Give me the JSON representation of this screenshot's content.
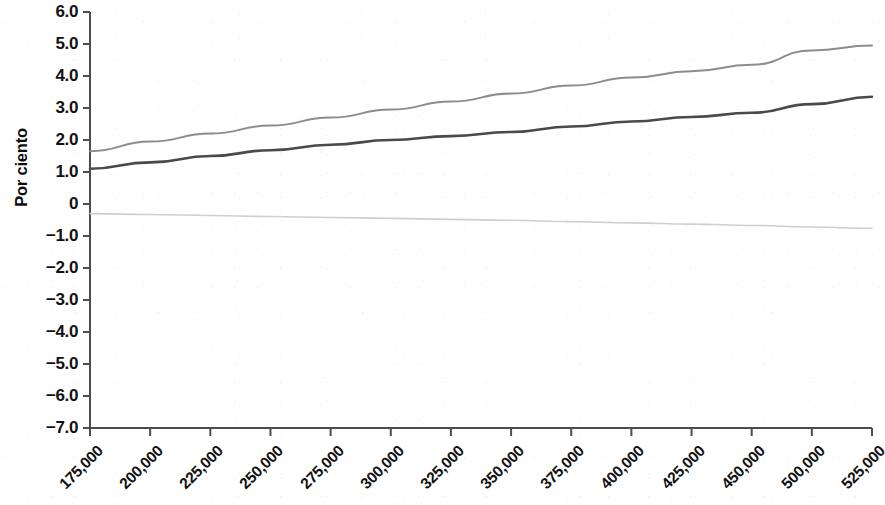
{
  "chart_data": {
    "type": "line",
    "title": "",
    "subtitle": "",
    "xlabel": "",
    "ylabel": "Por ciento",
    "grid": false,
    "legend": "none",
    "ylim": [
      -7.0,
      6.0
    ],
    "ytick_labels": [
      "6.0",
      "5.0",
      "4.0",
      "3.0",
      "2.0",
      "1.0",
      "0",
      "-1.0",
      "-2.0",
      "-3.0",
      "-4.0",
      "-5.0",
      "-6.0",
      "-7.0"
    ],
    "ytick_values": [
      6.0,
      5.0,
      4.0,
      3.0,
      2.0,
      1.0,
      0,
      -1.0,
      -2.0,
      -3.0,
      -4.0,
      -5.0,
      -6.0,
      -7.0
    ],
    "categories": [
      "175,000",
      "200,000",
      "225,000",
      "250,000",
      "275,000",
      "300,000",
      "325,000",
      "350,000",
      "375,000",
      "400,000",
      "425,000",
      "450,000",
      "500,000",
      "525,000"
    ],
    "series": [
      {
        "name": "upper",
        "color": "#8c8c8c",
        "width": 2.0,
        "values": [
          1.65,
          1.95,
          2.2,
          2.45,
          2.7,
          2.95,
          3.2,
          3.45,
          3.7,
          3.95,
          4.15,
          4.35,
          4.8,
          4.95
        ]
      },
      {
        "name": "middle",
        "color": "#4a4a4a",
        "width": 2.6,
        "values": [
          1.1,
          1.3,
          1.5,
          1.68,
          1.85,
          2.0,
          2.12,
          2.25,
          2.42,
          2.58,
          2.72,
          2.85,
          3.12,
          3.35
        ]
      },
      {
        "name": "lower",
        "color": "#cfcfcf",
        "width": 1.6,
        "values": [
          -0.3,
          -0.33,
          -0.36,
          -0.39,
          -0.42,
          -0.45,
          -0.48,
          -0.51,
          -0.55,
          -0.59,
          -0.63,
          -0.67,
          -0.72,
          -0.76
        ]
      }
    ],
    "axis_color": "#4d4d4d",
    "background": "#ffffff"
  }
}
